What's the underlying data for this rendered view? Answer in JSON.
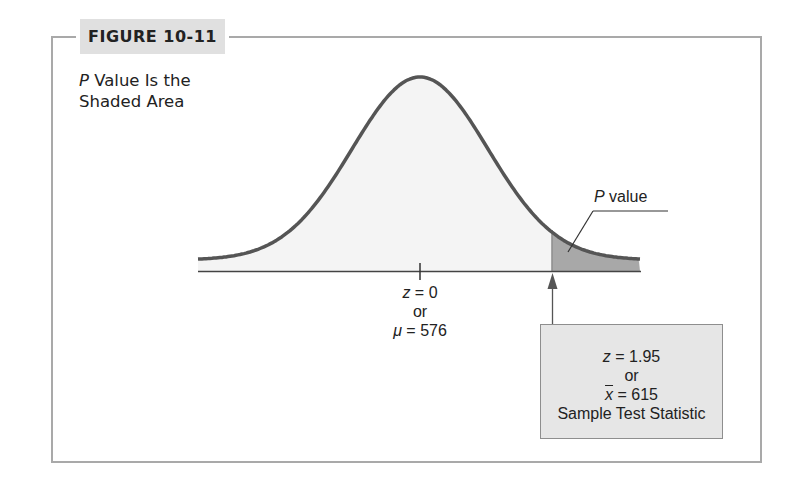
{
  "figure": {
    "tag": "FIGURE 10-11",
    "caption_italic": "P",
    "caption_line1_rest": " Value Is the",
    "caption_line2": "Shaded Area"
  },
  "annotations": {
    "p_value_italic": "P",
    "p_value_rest": " value",
    "mean": {
      "z_symbol": "z",
      "z_value": " = 0",
      "or": "or",
      "mu_symbol": "μ",
      "mu_value": " = 576"
    },
    "test_statistic": {
      "z_symbol": "z",
      "z_value": " = 1.95",
      "or": "or",
      "xbar_symbol": "x",
      "xbar_value": " = 615",
      "caption": "Sample Test Statistic"
    }
  },
  "colors": {
    "frame": "#a9a9a9",
    "tab_background": "#e0e0e0",
    "curve": "#555555",
    "curve_fill": "#f4f4f4",
    "tail_fill": "#a8a8a8",
    "box_fill": "#e6e6e6",
    "box_border": "#8e8e8e"
  },
  "chart_data": {
    "type": "area",
    "title": "P Value Is the Shaded Area",
    "distribution": "normal",
    "x_axis": "z",
    "mean_z": 0,
    "mean_value": 576,
    "test_statistic_z": 1.95,
    "test_statistic_xbar": 615,
    "shaded_region": "right tail, z >= 1.95",
    "shaded_label": "P value",
    "tick_labels": [
      "z = 0 or μ = 576"
    ],
    "grid": false,
    "legend": "none"
  }
}
